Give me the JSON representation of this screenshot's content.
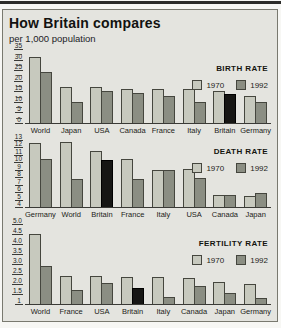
{
  "header": {
    "title": "How Britain compares",
    "subtitle": "per 1,000 population"
  },
  "colors": {
    "bar_1970": "#c7c9be",
    "bar_1992": "#8b8e83",
    "britain_highlight": "#161614",
    "panel_background": "#e4e4df"
  },
  "chart_data": [
    {
      "type": "bar",
      "title": "BIRTH RATE",
      "categories": [
        "World",
        "Japan",
        "USA",
        "Canada",
        "France",
        "Italy",
        "Britain",
        "Germany"
      ],
      "series": [
        {
          "name": "1970",
          "values": [
            31,
            17,
            17,
            16,
            16,
            16,
            15,
            13
          ]
        },
        {
          "name": "1992",
          "values": [
            24,
            10,
            15,
            14,
            13,
            10,
            13.5,
            10
          ]
        }
      ],
      "ylim": [
        0,
        35
      ],
      "yticks": [
        "35",
        "30",
        "25",
        "20",
        "15",
        "10",
        "5",
        "0"
      ],
      "minor_ticks": true,
      "highlight": {
        "category": "Britain",
        "series": "1992"
      },
      "legend_position": "top-right"
    },
    {
      "type": "bar",
      "title": "DEATH RATE",
      "categories": [
        "Germany",
        "World",
        "Britain",
        "France",
        "Italy",
        "USA",
        "Canada",
        "Japan"
      ],
      "series": [
        {
          "name": "1970",
          "values": [
            12.6,
            12.7,
            11.5,
            10.4,
            9,
            9.1,
            5.6,
            5.5
          ]
        },
        {
          "name": "1992",
          "values": [
            10.4,
            7.8,
            10.3,
            7.8,
            9,
            7.9,
            5.6,
            5.9
          ]
        }
      ],
      "ylim": [
        4,
        13
      ],
      "yticks": [
        "13",
        "12",
        "11",
        "10",
        "9",
        "8",
        "7",
        "6",
        "5",
        "4"
      ],
      "minor_ticks": false,
      "highlight": {
        "category": "Britain",
        "series": "1992"
      },
      "legend_position": "top-right"
    },
    {
      "type": "bar",
      "title": "FERTILITY RATE",
      "categories": [
        "World",
        "France",
        "USA",
        "Britain",
        "Italy",
        "Canada",
        "Japan",
        "Germany"
      ],
      "series": [
        {
          "name": "1970",
          "values": [
            4.5,
            2.4,
            2.4,
            2.35,
            2.35,
            2.3,
            2.1,
            2.0
          ]
        },
        {
          "name": "1992",
          "values": [
            2.9,
            1.7,
            2.05,
            1.8,
            1.35,
            1.9,
            1.55,
            1.3
          ]
        }
      ],
      "ylim": [
        1,
        5
      ],
      "yticks": [
        "5.0",
        "4.5",
        "4.0",
        "3.5",
        "3.0",
        "2.5",
        "2.0",
        "1.5",
        "1"
      ],
      "minor_ticks": false,
      "highlight": {
        "category": "Britain",
        "series": "1992"
      },
      "legend_position": "top-right"
    }
  ],
  "legend": {
    "label_1970": "1970",
    "label_1992": "1992"
  }
}
